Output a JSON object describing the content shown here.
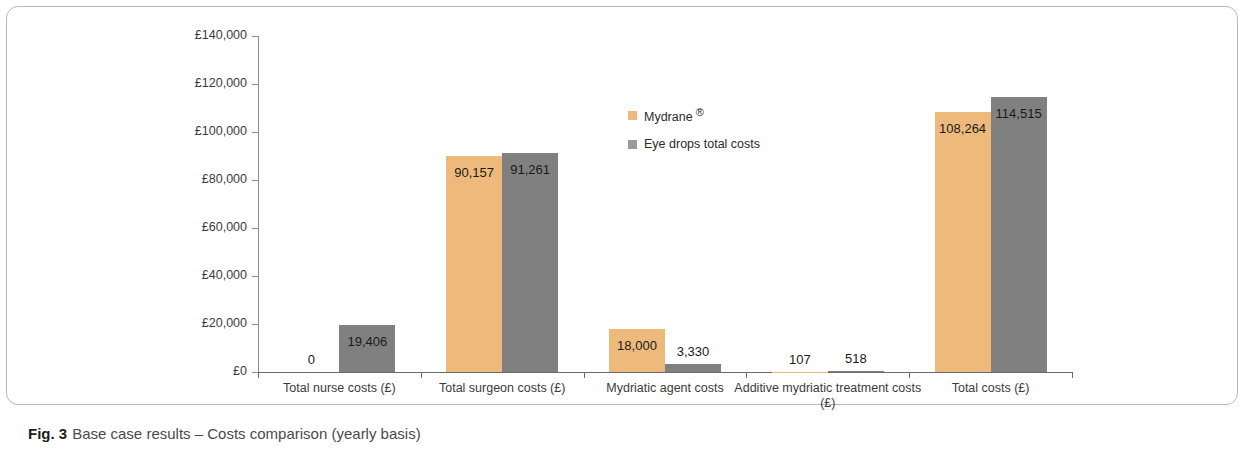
{
  "figure": {
    "caption_number": "Fig. 3",
    "caption_text": "Base case results – Costs comparison (yearly basis)"
  },
  "legend": {
    "position": "inside-top-center",
    "items": [
      {
        "label": "Mydrane",
        "suffix": "®",
        "color": "#eeba7c",
        "swatch_name": "legend-swatch-mydrane"
      },
      {
        "label": "Eye drops total costs",
        "suffix": "",
        "color": "#9a9a9a",
        "swatch_name": "legend-swatch-eye-drops"
      }
    ]
  },
  "chart_data": {
    "type": "bar",
    "title": "",
    "subtitle": "",
    "xlabel": "",
    "ylabel": "",
    "ylim": [
      0,
      140000
    ],
    "ytick_labels": [
      "£0",
      "£20,000",
      "£40,000",
      "£60,000",
      "£80,000",
      "£100,000",
      "£120,000",
      "£140,000"
    ],
    "ytick_values": [
      0,
      20000,
      40000,
      60000,
      80000,
      100000,
      120000,
      140000
    ],
    "grid": false,
    "currency": "£",
    "categories": [
      "Total nurse costs (£)",
      "Total surgeon costs (£)",
      "Mydriatic agent costs",
      "Additive mydriatic treatment costs (£)",
      "Total costs (£)"
    ],
    "series": [
      {
        "name": "Mydrane ®",
        "color": "#eeba7c",
        "values": [
          0,
          90157,
          18000,
          107,
          108264
        ],
        "labels": [
          "0",
          "90,157",
          "18,000",
          "107",
          "108,264"
        ]
      },
      {
        "name": "Eye drops total costs",
        "color": "#808080",
        "values": [
          19406,
          91261,
          3330,
          518,
          114515
        ],
        "labels": [
          "19,406",
          "91,261",
          "3,330",
          "518",
          "114,515"
        ]
      }
    ]
  }
}
